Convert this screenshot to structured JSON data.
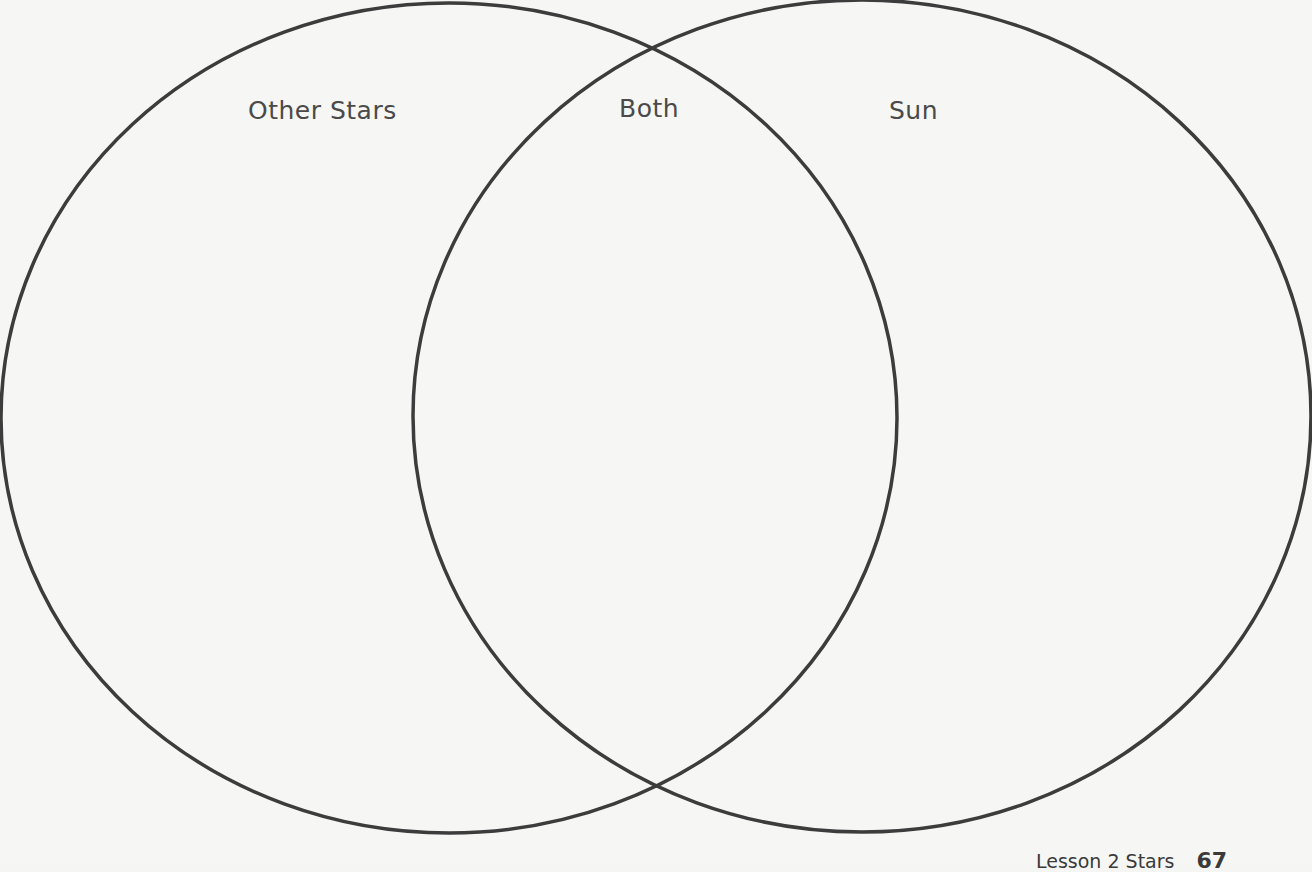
{
  "diagram": {
    "type": "venn",
    "sets": [
      {
        "id": "left",
        "label": "Other Stars",
        "cx": 449,
        "cy": 418,
        "rx": 448,
        "ry": 415
      },
      {
        "id": "right",
        "label": "Sun",
        "cx": 862,
        "cy": 416,
        "rx": 449,
        "ry": 416
      }
    ],
    "intersection_label": "Both",
    "stroke_color": "#3c3c3c",
    "background_color": "#f6f6f4"
  },
  "labels": {
    "left": "Other Stars",
    "both": "Both",
    "right": "Sun"
  },
  "footer": {
    "lesson": "Lesson 2  Stars",
    "page_number": "67"
  }
}
